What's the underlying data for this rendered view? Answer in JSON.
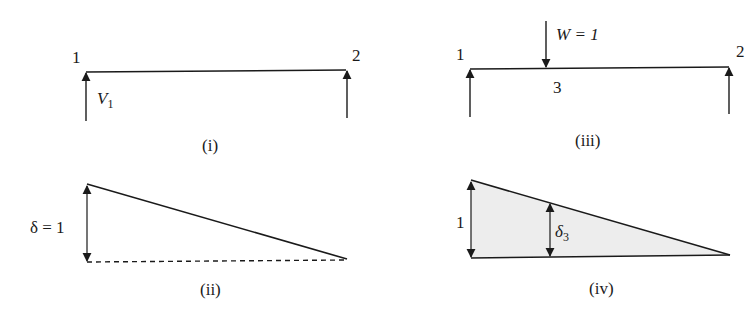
{
  "figure": {
    "panels": [
      {
        "id": "i",
        "caption": "(i)",
        "description": "Simply supported beam with reaction V1 at node 1",
        "node_labels": [
          "1",
          "2"
        ],
        "force_label": "V",
        "force_subscript": "1"
      },
      {
        "id": "ii",
        "caption": "(ii)",
        "description": "Deflected shape with unit displacement at node 1",
        "displacement_label": "δ = 1"
      },
      {
        "id": "iii",
        "caption": "(iii)",
        "description": "Beam with unit load W at point 3",
        "node_labels": [
          "1",
          "2",
          "3"
        ],
        "load_label": "W = 1"
      },
      {
        "id": "iv",
        "caption": "(iv)",
        "description": "Influence line triangle with ordinate δ3 at point 3",
        "ordinate_label": "1",
        "delta_label": "δ",
        "delta_subscript": "3"
      }
    ],
    "colors": {
      "line": "#1a1a1a",
      "shade": "#ededed",
      "background": "#ffffff"
    }
  }
}
